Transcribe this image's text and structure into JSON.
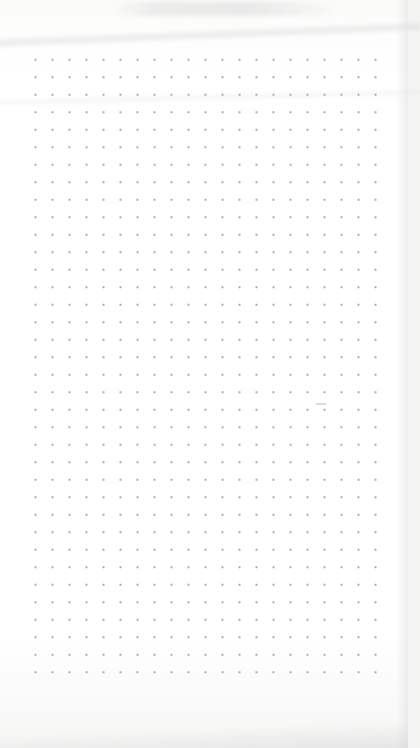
{
  "image": {
    "subject": "dot-grid notebook page",
    "description": "Blank page of a dotted notebook photographed from above",
    "grid": {
      "columns": 22,
      "rows": 37,
      "dot_color": "#9a9a9a",
      "spacing_px": 17.5
    },
    "colors": {
      "paper": "#ffffff",
      "shadow": "#e0e0e0"
    }
  }
}
